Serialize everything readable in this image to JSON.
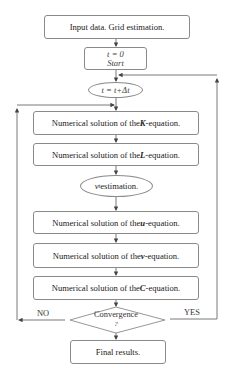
{
  "flowchart": {
    "input": "Input data. Grid estimation.",
    "start_time": "t = 0",
    "start": "Start",
    "time_step": "t = t+Δt",
    "k_step": {
      "prefix": "Numerical solution of the ",
      "var": "K",
      "suffix": "-equation."
    },
    "l_step": {
      "prefix": "Numerical solution of the ",
      "var": "L",
      "suffix": "-equation."
    },
    "nu_step": {
      "var": "ν",
      "sub": "t",
      "suffix": " estimation."
    },
    "u_step": {
      "prefix": "Numerical solution of the ",
      "var": "u",
      "suffix": "-equation."
    },
    "v_step": {
      "prefix": "Numerical solution of the ",
      "var": "v",
      "suffix": "-equation."
    },
    "c_step": {
      "prefix": "Numerical solution of the ",
      "var": "C",
      "suffix": "-equation."
    },
    "decision": "Convergence",
    "decision_q": "?",
    "no_label": "NO",
    "yes_label": "YES",
    "final": "Final results."
  },
  "colors": {
    "line": "#6a6a6a",
    "border": "#8a8a8a",
    "text": "#222222"
  }
}
